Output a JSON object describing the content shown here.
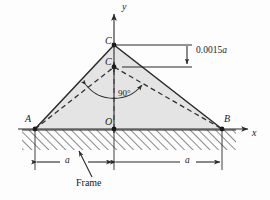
{
  "figure": {
    "axes": {
      "y_label": "y",
      "x_label": "x"
    },
    "points": {
      "A": "A",
      "B": "B",
      "C": "C",
      "C1_base": "C",
      "C1_sub": "1",
      "O": "O"
    },
    "annotations": {
      "angle": "90°",
      "deflection_value": "0.0015",
      "deflection_unit": "a",
      "dim_left": "a",
      "dim_right": "a",
      "frame_label": "Frame"
    },
    "colors": {
      "line": "#2b2b2b",
      "fill": "#e4e4e4",
      "hatch": "#2b2b2b",
      "dashed": "#3a3a3a",
      "background": "#fdfdfd"
    },
    "geometry": {
      "origin_x": 114,
      "origin_y": 129,
      "A_x": 35,
      "B_x": 222,
      "C_y": 45,
      "C1_y": 67,
      "ground_depth": 22
    }
  }
}
